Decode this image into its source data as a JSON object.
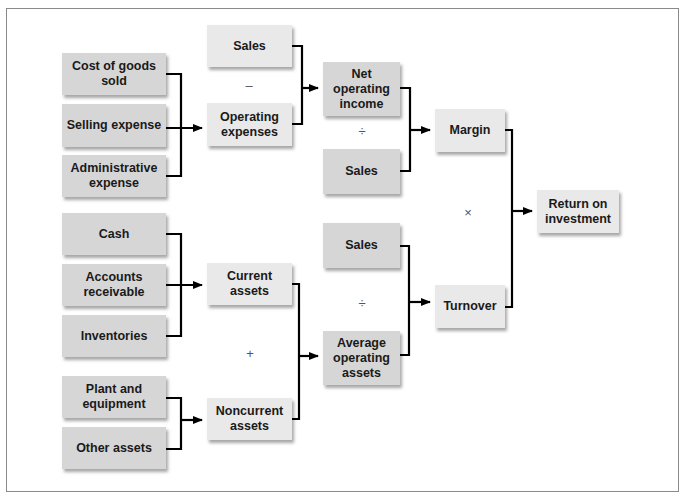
{
  "diagram": {
    "colors": {
      "dark_box": "#d6d6d6",
      "light_box": "#e9e9e9",
      "line": "#000000",
      "frame": "#8a8a8a"
    },
    "nodes": {
      "cost_of_goods_sold": "Cost of goods sold",
      "selling_expense": "Selling expense",
      "administrative_expense": "Administrative expense",
      "cash": "Cash",
      "accounts_receivable": "Accounts receivable",
      "inventories": "Inventories",
      "plant_and_equipment": "Plant and equipment",
      "other_assets": "Other assets",
      "sales_top": "Sales",
      "operating_expenses": "Operating expenses",
      "current_assets": "Current assets",
      "noncurrent_assets": "Noncurrent assets",
      "net_operating_income": "Net operating income",
      "sales_margin": "Sales",
      "sales_turnover": "Sales",
      "average_operating_assets": "Average operating assets",
      "margin": "Margin",
      "turnover": "Turnover",
      "return_on_investment": "Return on investment"
    },
    "operators": {
      "minus": "–",
      "divide_margin": "÷",
      "multiply": "×",
      "divide_turnover": "÷",
      "plus": "+"
    },
    "edges": [
      [
        "cost_of_goods_sold",
        "operating_expenses"
      ],
      [
        "selling_expense",
        "operating_expenses"
      ],
      [
        "administrative_expense",
        "operating_expenses"
      ],
      [
        "sales_top",
        "net_operating_income"
      ],
      [
        "operating_expenses",
        "net_operating_income"
      ],
      [
        "net_operating_income",
        "margin"
      ],
      [
        "sales_margin",
        "margin"
      ],
      [
        "cash",
        "current_assets"
      ],
      [
        "accounts_receivable",
        "current_assets"
      ],
      [
        "inventories",
        "current_assets"
      ],
      [
        "plant_and_equipment",
        "noncurrent_assets"
      ],
      [
        "other_assets",
        "noncurrent_assets"
      ],
      [
        "current_assets",
        "average_operating_assets"
      ],
      [
        "noncurrent_assets",
        "average_operating_assets"
      ],
      [
        "sales_turnover",
        "turnover"
      ],
      [
        "average_operating_assets",
        "turnover"
      ],
      [
        "margin",
        "return_on_investment"
      ],
      [
        "turnover",
        "return_on_investment"
      ]
    ]
  }
}
